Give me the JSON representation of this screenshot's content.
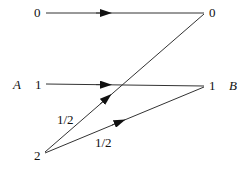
{
  "diagram": {
    "left_nodes": [
      {
        "label": "0"
      },
      {
        "label": "1",
        "set_label": "A"
      },
      {
        "label": "2"
      }
    ],
    "right_nodes": [
      {
        "label": "0"
      },
      {
        "label": "1",
        "set_label": "B"
      }
    ],
    "edges": [
      {
        "from": "0",
        "to": "0",
        "label": ""
      },
      {
        "from": "1",
        "to": "1",
        "label": ""
      },
      {
        "from": "2",
        "to": "0",
        "label": "1/2"
      },
      {
        "from": "2",
        "to": "1",
        "label": "1/2"
      }
    ],
    "colors": {
      "line": "#333333",
      "text": "#111111"
    }
  }
}
